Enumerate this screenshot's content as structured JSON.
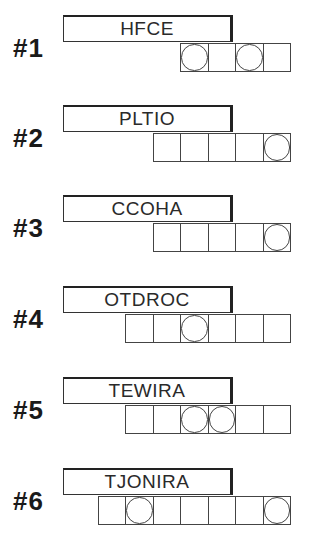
{
  "puzzles": [
    {
      "label": "#1",
      "scrambled": "HFCE",
      "length": 4,
      "circled": [
        0,
        2
      ]
    },
    {
      "label": "#2",
      "scrambled": "PLTIO",
      "length": 5,
      "circled": [
        4
      ]
    },
    {
      "label": "#3",
      "scrambled": "CCOHA",
      "length": 5,
      "circled": [
        4
      ]
    },
    {
      "label": "#4",
      "scrambled": "OTDROC",
      "length": 6,
      "circled": [
        2
      ]
    },
    {
      "label": "#5",
      "scrambled": "TEWIRA",
      "length": 6,
      "circled": [
        2,
        3
      ]
    },
    {
      "label": "#6",
      "scrambled": "TJONIRA",
      "length": 7,
      "circled": [
        1,
        6
      ]
    }
  ],
  "colors": {
    "background": "#ffffff",
    "ink": "#222222"
  }
}
